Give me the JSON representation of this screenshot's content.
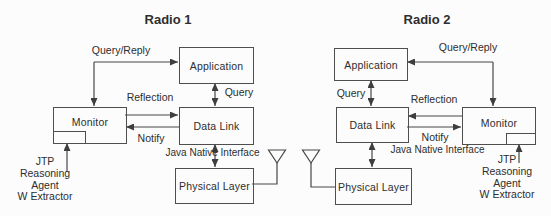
{
  "radio1": {
    "title": "Radio 1",
    "boxes": {
      "application": "Application",
      "data_link": "Data Link",
      "monitor": "Monitor",
      "physical_layer": "Physical Layer"
    },
    "labels": {
      "query_reply": "Query/Reply",
      "query": "Query",
      "reflection": "Reflection",
      "notify": "Notify",
      "jni": "Java Native Interface"
    },
    "agent": {
      "line1": "JTP",
      "line2": "Reasoning",
      "line3": "Agent",
      "line4": "W Extractor"
    }
  },
  "radio2": {
    "title": "Radio 2",
    "boxes": {
      "application": "Application",
      "data_link": "Data Link",
      "monitor": "Monitor",
      "physical_layer": "Physical Layer"
    },
    "labels": {
      "query_reply": "Query/Reply",
      "query": "Query",
      "reflection": "Reflection",
      "notify": "Notify",
      "jni": "Java Native Interface"
    },
    "agent": {
      "line1": "JTP",
      "line2": "Reasoning",
      "line3": "Agent",
      "line4": "W Extractor"
    }
  },
  "colors": {
    "line": "#474747",
    "border": "#4e4e4e",
    "text": "#2e2e2e",
    "background": "#fcfcfc"
  }
}
